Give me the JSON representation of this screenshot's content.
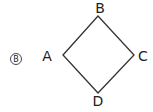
{
  "option": {
    "label": "B"
  },
  "figure": {
    "shape": "square",
    "vertices": [
      {
        "name": "A",
        "x": 63,
        "y": 55,
        "lx": 52,
        "ly": 60
      },
      {
        "name": "B",
        "x": 98,
        "y": 16,
        "lx": 100,
        "ly": 13
      },
      {
        "name": "C",
        "x": 134,
        "y": 55,
        "lx": 142,
        "ly": 60
      },
      {
        "name": "D",
        "x": 98,
        "y": 93,
        "lx": 98,
        "ly": 106
      }
    ],
    "stroke_color": "#333333"
  }
}
